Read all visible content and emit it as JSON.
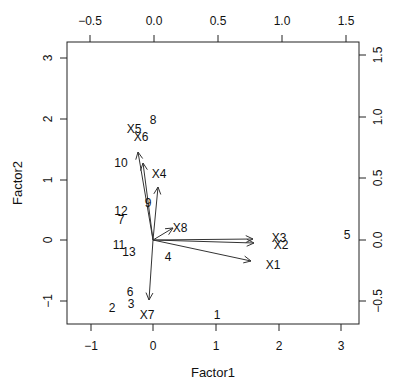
{
  "chart_data": {
    "type": "scatter",
    "subtype": "biplot",
    "title": "",
    "xlabel": "Factor1",
    "ylabel": "Factor2",
    "xlim": [
      -1.4,
      3.3
    ],
    "ylim": [
      -1.38,
      3.25
    ],
    "x_ticks": [
      -1,
      0,
      1,
      2,
      3
    ],
    "y_ticks": [
      -1,
      0,
      1,
      2,
      3
    ],
    "top_axis": {
      "ticks": [
        -0.5,
        0.0,
        0.5,
        1.0,
        1.5
      ],
      "tick_labels": [
        "-0.5",
        "0.0",
        "0.5",
        "1.0",
        "1.5"
      ],
      "lim": [
        -0.69,
        1.6
      ]
    },
    "right_axis": {
      "ticks": [
        -0.5,
        0.0,
        0.5,
        1.0,
        1.5
      ],
      "tick_labels": [
        "-0.5",
        "0.0",
        "0.5",
        "1.0",
        "1.5"
      ],
      "lim": [
        -0.69,
        1.6
      ]
    },
    "grid": false,
    "legend": null,
    "scores": [
      {
        "label": "1",
        "x": 1.02,
        "y": -1.24
      },
      {
        "label": "2",
        "x": -0.66,
        "y": -1.12
      },
      {
        "label": "3",
        "x": -0.35,
        "y": -1.05
      },
      {
        "label": "4",
        "x": 0.24,
        "y": -0.28
      },
      {
        "label": "5",
        "x": 3.1,
        "y": 0.08
      },
      {
        "label": "6",
        "x": -0.37,
        "y": -0.86
      },
      {
        "label": "7",
        "x": -0.51,
        "y": 0.33
      },
      {
        "label": "8",
        "x": 0.0,
        "y": 1.98
      },
      {
        "label": "9",
        "x": -0.08,
        "y": 0.61
      },
      {
        "label": "10",
        "x": -0.51,
        "y": 1.27
      },
      {
        "label": "11",
        "x": -0.54,
        "y": -0.08
      },
      {
        "label": "12",
        "x": -0.51,
        "y": 0.47
      },
      {
        "label": "13",
        "x": -0.38,
        "y": -0.2
      }
    ],
    "loadings": [
      {
        "label": "X1",
        "x": 0.76,
        "y": -0.17
      },
      {
        "label": "X2",
        "x": 0.79,
        "y": -0.02
      },
      {
        "label": "X3",
        "x": 0.78,
        "y": 0.01
      },
      {
        "label": "X4",
        "x": 0.04,
        "y": 0.43
      },
      {
        "label": "X5",
        "x": -0.12,
        "y": 0.72
      },
      {
        "label": "X6",
        "x": -0.08,
        "y": 0.63
      },
      {
        "label": "X7",
        "x": -0.03,
        "y": -0.49
      },
      {
        "label": "X8",
        "x": 0.16,
        "y": 0.1
      }
    ]
  },
  "layout": {
    "plot_box": {
      "left": 67,
      "top": 42,
      "right": 359,
      "bottom": 324
    },
    "origin_px": {
      "x": 153,
      "y": 240
    },
    "px_per_unit_bottom": 62.5,
    "px_per_unit_left": 60.7,
    "px_per_unit_top": 128,
    "px_per_unit_right": 123
  },
  "score_positions": [
    {
      "label": "1",
      "px": 217,
      "py": 316
    },
    {
      "label": "2",
      "px": 112,
      "py": 309
    },
    {
      "label": "3",
      "px": 131,
      "py": 305
    },
    {
      "label": "4",
      "px": 168,
      "py": 258
    },
    {
      "label": "5",
      "px": 347,
      "py": 236
    },
    {
      "label": "6",
      "px": 130,
      "py": 293
    },
    {
      "label": "7",
      "px": 121,
      "py": 221
    },
    {
      "label": "8",
      "px": 153,
      "py": 121
    },
    {
      "label": "9",
      "px": 148,
      "py": 204
    },
    {
      "label": "10",
      "px": 121,
      "py": 164
    },
    {
      "label": "11",
      "px": 119,
      "py": 246
    },
    {
      "label": "12",
      "px": 121,
      "py": 212
    },
    {
      "label": "13",
      "px": 129,
      "py": 253
    }
  ],
  "loading_arrows": [
    {
      "label": "X1",
      "tip_x": 251,
      "tip_y": 261,
      "label_x": 273,
      "label_y": 266
    },
    {
      "label": "X2",
      "tip_x": 254,
      "tip_y": 243,
      "label_x": 281,
      "label_y": 246
    },
    {
      "label": "X3",
      "tip_x": 253,
      "tip_y": 239,
      "label_x": 279,
      "label_y": 239
    },
    {
      "label": "X4",
      "tip_x": 158,
      "tip_y": 187,
      "label_x": 159,
      "label_y": 175
    },
    {
      "label": "X5",
      "tip_x": 138,
      "tip_y": 152,
      "label_x": 134,
      "label_y": 130
    },
    {
      "label": "X6",
      "tip_x": 143,
      "tip_y": 163,
      "label_x": 141,
      "label_y": 138
    },
    {
      "label": "X7",
      "tip_x": 149,
      "tip_y": 300,
      "label_x": 147,
      "label_y": 316
    },
    {
      "label": "X8",
      "tip_x": 173,
      "tip_y": 228,
      "label_x": 180,
      "label_y": 229
    }
  ],
  "axes_text": {
    "bottom_ticks": [
      {
        "label": "-1",
        "px": 91
      },
      {
        "label": "0",
        "px": 153
      },
      {
        "label": "1",
        "px": 216
      },
      {
        "label": "2",
        "px": 279
      },
      {
        "label": "3",
        "px": 341
      }
    ],
    "left_ticks": [
      {
        "label": "3",
        "py": 58
      },
      {
        "label": "2",
        "py": 119
      },
      {
        "label": "1",
        "py": 180
      },
      {
        "label": "0",
        "py": 240
      },
      {
        "label": "-1",
        "py": 301
      }
    ],
    "top_ticks": [
      {
        "label": "-0.5",
        "px": 90
      },
      {
        "label": "0.0",
        "px": 154
      },
      {
        "label": "0.5",
        "px": 218
      },
      {
        "label": "1.0",
        "px": 282
      },
      {
        "label": "1.5",
        "px": 346
      }
    ],
    "right_ticks": [
      {
        "label": "1.5",
        "py": 55
      },
      {
        "label": "1.0",
        "py": 117
      },
      {
        "label": "0.5",
        "py": 178
      },
      {
        "label": "0.0",
        "py": 240
      },
      {
        "label": "-0.5",
        "py": 301
      }
    ],
    "xlabel": "Factor1",
    "ylabel": "Factor2"
  }
}
